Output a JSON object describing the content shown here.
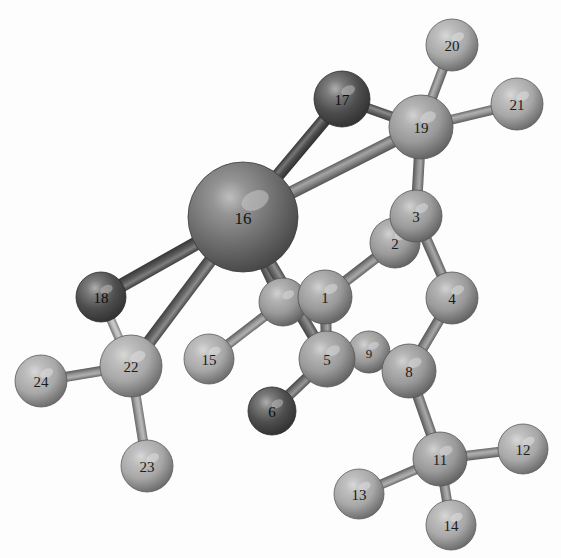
{
  "figure": {
    "kind": "molecular-structure-diagram",
    "background_color": "#fdfdfd",
    "width": 561,
    "height": 558,
    "style": "grayscale shaded spheres with cylindrical bonds"
  },
  "palette": {
    "metal": "#6f6f6f",
    "metal_dark": "#4a4a4a",
    "heteroatom_dark": "#4e4e4e",
    "heteroatom_darker": "#3a3a3a",
    "carbon": "#9a9a9a",
    "carbon_light": "#a8a8a8",
    "hydrogen": "#ababab",
    "bond": "#8e8e8e",
    "bond_dark": "#585858",
    "bond_light": "#c9c9c9",
    "label_text": "#1c1c1c"
  },
  "atoms": [
    {
      "id": "a1",
      "label": "1",
      "x": 325,
      "y": 297,
      "r": 27,
      "color": "#9a9a9a",
      "kind": "carbon"
    },
    {
      "id": "a2",
      "label": "2",
      "x": 395,
      "y": 243,
      "r": 25,
      "color": "#9a9a9a",
      "kind": "carbon"
    },
    {
      "id": "a3",
      "label": "3",
      "x": 416,
      "y": 216,
      "r": 26,
      "color": "#9a9a9a",
      "kind": "carbon"
    },
    {
      "id": "a4",
      "label": "4",
      "x": 452,
      "y": 298,
      "r": 26,
      "color": "#9a9a9a",
      "kind": "carbon"
    },
    {
      "id": "a5",
      "label": "5",
      "x": 327,
      "y": 359,
      "r": 28,
      "color": "#9a9a9a",
      "kind": "carbon"
    },
    {
      "id": "a6",
      "label": "6",
      "x": 272,
      "y": 411,
      "r": 24,
      "color": "#4e4e4e",
      "kind": "heteroatom"
    },
    {
      "id": "a7",
      "label": "",
      "x": 283,
      "y": 302,
      "r": 24,
      "color": "#9a9a9a",
      "kind": "carbon"
    },
    {
      "id": "a8",
      "label": "8",
      "x": 409,
      "y": 371,
      "r": 27,
      "color": "#9a9a9a",
      "kind": "carbon"
    },
    {
      "id": "a9",
      "label": "9",
      "x": 369,
      "y": 352,
      "r": 21,
      "color": "#9a9a9a",
      "kind": "carbon"
    },
    {
      "id": "a11",
      "label": "11",
      "x": 440,
      "y": 459,
      "r": 27,
      "color": "#9a9a9a",
      "kind": "carbon"
    },
    {
      "id": "a12",
      "label": "12",
      "x": 523,
      "y": 449,
      "r": 25,
      "color": "#a8a8a8",
      "kind": "hydrogen"
    },
    {
      "id": "a13",
      "label": "13",
      "x": 359,
      "y": 494,
      "r": 25,
      "color": "#a8a8a8",
      "kind": "hydrogen"
    },
    {
      "id": "a14",
      "label": "14",
      "x": 451,
      "y": 525,
      "r": 25,
      "color": "#a8a8a8",
      "kind": "hydrogen"
    },
    {
      "id": "a15",
      "label": "15",
      "x": 209,
      "y": 359,
      "r": 25,
      "color": "#a8a8a8",
      "kind": "hydrogen"
    },
    {
      "id": "a16",
      "label": "16",
      "x": 243,
      "y": 217,
      "r": 55,
      "color": "#6f6f6f",
      "kind": "metal"
    },
    {
      "id": "a17",
      "label": "17",
      "x": 342,
      "y": 99,
      "r": 28,
      "color": "#4e4e4e",
      "kind": "heteroatom"
    },
    {
      "id": "a18",
      "label": "18",
      "x": 101,
      "y": 297,
      "r": 25,
      "color": "#4e4e4e",
      "kind": "heteroatom"
    },
    {
      "id": "a19",
      "label": "19",
      "x": 421,
      "y": 127,
      "r": 32,
      "color": "#9a9a9a",
      "kind": "carbon"
    },
    {
      "id": "a20",
      "label": "20",
      "x": 452,
      "y": 45,
      "r": 26,
      "color": "#a8a8a8",
      "kind": "hydrogen"
    },
    {
      "id": "a21",
      "label": "21",
      "x": 517,
      "y": 104,
      "r": 26,
      "color": "#a8a8a8",
      "kind": "hydrogen"
    },
    {
      "id": "a22",
      "label": "22",
      "x": 131,
      "y": 366,
      "r": 31,
      "color": "#a8a8a8",
      "kind": "carbon"
    },
    {
      "id": "a23",
      "label": "23",
      "x": 147,
      "y": 466,
      "r": 26,
      "color": "#a8a8a8",
      "kind": "hydrogen"
    },
    {
      "id": "a24",
      "label": "24",
      "x": 41,
      "y": 381,
      "r": 26,
      "color": "#a8a8a8",
      "kind": "hydrogen"
    }
  ],
  "bonds": [
    {
      "from": "a16",
      "to": "a17",
      "width": 13,
      "color": "#4f4f4f",
      "style": "dark"
    },
    {
      "from": "a16",
      "to": "a19",
      "width": 13,
      "color": "#8a8a8a",
      "style": "highlight"
    },
    {
      "from": "a16",
      "to": "a18",
      "width": 14,
      "color": "#5a5a5a",
      "style": "dark"
    },
    {
      "from": "a16",
      "to": "a22",
      "width": 13,
      "color": "#6a6a6a",
      "style": "dark"
    },
    {
      "from": "a16",
      "to": "a7",
      "width": 13,
      "color": "#707070",
      "style": "dark"
    },
    {
      "from": "a16",
      "to": "a5",
      "width": 12,
      "color": "#707070",
      "style": "dark"
    },
    {
      "from": "a17",
      "to": "a19",
      "width": 10,
      "color": "#6a6a6a",
      "style": "normal"
    },
    {
      "from": "a19",
      "to": "a20",
      "width": 10,
      "color": "#9a9a9a",
      "style": "normal"
    },
    {
      "from": "a19",
      "to": "a21",
      "width": 10,
      "color": "#9a9a9a",
      "style": "normal"
    },
    {
      "from": "a19",
      "to": "a3",
      "width": 11,
      "color": "#909090",
      "style": "normal"
    },
    {
      "from": "a3",
      "to": "a4",
      "width": 11,
      "color": "#909090",
      "style": "normal"
    },
    {
      "from": "a2",
      "to": "a1",
      "width": 11,
      "color": "#909090",
      "style": "normal"
    },
    {
      "from": "a4",
      "to": "a8",
      "width": 11,
      "color": "#909090",
      "style": "normal"
    },
    {
      "from": "a1",
      "to": "a5",
      "width": 11,
      "color": "#8a8a8a",
      "style": "normal"
    },
    {
      "from": "a5",
      "to": "a9",
      "width": 10,
      "color": "#8a8a8a",
      "style": "normal"
    },
    {
      "from": "a9",
      "to": "a8",
      "width": 10,
      "color": "#8a8a8a",
      "style": "normal"
    },
    {
      "from": "a5",
      "to": "a6",
      "width": 11,
      "color": "#7a7a7a",
      "style": "normal"
    },
    {
      "from": "a7",
      "to": "a15",
      "width": 10,
      "color": "#9a9a9a",
      "style": "normal"
    },
    {
      "from": "a7",
      "to": "a1",
      "width": 10,
      "color": "#909090",
      "style": "normal"
    },
    {
      "from": "a8",
      "to": "a11",
      "width": 11,
      "color": "#909090",
      "style": "normal"
    },
    {
      "from": "a11",
      "to": "a12",
      "width": 10,
      "color": "#9a9a9a",
      "style": "normal"
    },
    {
      "from": "a11",
      "to": "a13",
      "width": 10,
      "color": "#9a9a9a",
      "style": "normal"
    },
    {
      "from": "a11",
      "to": "a14",
      "width": 10,
      "color": "#9a9a9a",
      "style": "normal"
    },
    {
      "from": "a18",
      "to": "a22",
      "width": 9,
      "color": "#bdbdbd",
      "style": "light"
    },
    {
      "from": "a22",
      "to": "a23",
      "width": 10,
      "color": "#a8a8a8",
      "style": "normal"
    },
    {
      "from": "a22",
      "to": "a24",
      "width": 10,
      "color": "#9a9a9a",
      "style": "normal"
    }
  ]
}
